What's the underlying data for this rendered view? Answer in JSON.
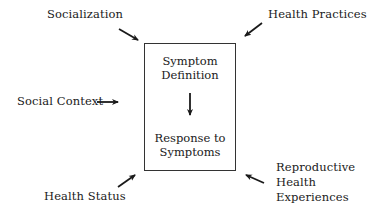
{
  "diagram": {
    "center_box": {
      "top_label_line1": "Symptom",
      "top_label_line2": "Definition",
      "bottom_label_line1": "Response to",
      "bottom_label_line2": "Symptoms",
      "internal_arrow": "down-arrow"
    },
    "influences": [
      {
        "id": "socialization",
        "label": "Socialization",
        "position": "top-left"
      },
      {
        "id": "health-practices",
        "label": "Health Practices",
        "position": "top-right"
      },
      {
        "id": "social-context",
        "label": "Social Context",
        "position": "left"
      },
      {
        "id": "health-status",
        "label": "Health Status",
        "position": "bottom-left"
      },
      {
        "id": "reproductive",
        "label_line1": "Reproductive",
        "label_line2": "Health",
        "label_line3": "Experiences",
        "position": "bottom-right"
      }
    ],
    "colors": {
      "stroke": "#1a1a1a",
      "background": "#ffffff"
    }
  }
}
